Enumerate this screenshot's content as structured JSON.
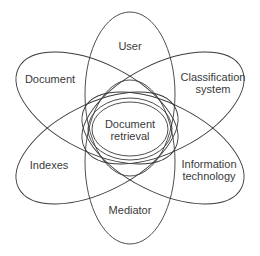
{
  "diagram": {
    "type": "venn-flower",
    "center": {
      "label_line1": "Document",
      "label_line2": "retrieval"
    },
    "petals": [
      {
        "id": "user",
        "label_line1": "User",
        "label_line2": ""
      },
      {
        "id": "classification-system",
        "label_line1": "Classification",
        "label_line2": "system"
      },
      {
        "id": "information-technology",
        "label_line1": "Information",
        "label_line2": "technology"
      },
      {
        "id": "mediator",
        "label_line1": "Mediator",
        "label_line2": ""
      },
      {
        "id": "indexes",
        "label_line1": "Indexes",
        "label_line2": ""
      },
      {
        "id": "document",
        "label_line1": "Document",
        "label_line2": ""
      }
    ],
    "colors": {
      "stroke": "#3a3a3a",
      "background": "#ffffff",
      "text": "#3a3a3a"
    }
  }
}
